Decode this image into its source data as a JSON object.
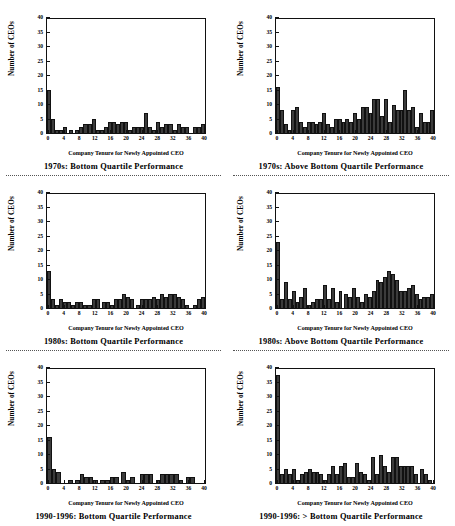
{
  "figure": {
    "axis": {
      "ylabel": "Number of CEOs",
      "xlabel": "Company Tenure for Newly Appointed CEO",
      "yticks": [
        0,
        5,
        10,
        15,
        20,
        25,
        30,
        35,
        40
      ],
      "xticks": [
        0,
        4,
        8,
        12,
        16,
        20,
        24,
        28,
        32,
        36,
        40
      ],
      "ylim": [
        0,
        40
      ],
      "xlim": [
        0,
        41
      ],
      "bar_color": "#3b3b3b",
      "frame_color": "#111111"
    }
  },
  "chart_data": [
    {
      "type": "bar",
      "panel": "top-left",
      "title": "1970s:  Bottom  Quartile  Performance",
      "xlabel": "Company Tenure for Newly Appointed CEO",
      "ylabel": "Number of CEOs",
      "ylim": [
        0,
        40
      ],
      "grid": false,
      "legend": "none",
      "categories": [
        0,
        1,
        2,
        3,
        4,
        5,
        6,
        7,
        8,
        9,
        10,
        11,
        12,
        13,
        14,
        15,
        16,
        17,
        18,
        19,
        20,
        21,
        22,
        23,
        24,
        25,
        26,
        27,
        28,
        29,
        30,
        31,
        32,
        33,
        34,
        35,
        36,
        37,
        38,
        39,
        40
      ],
      "values": [
        15,
        5,
        1,
        1,
        2,
        0,
        1,
        0,
        1,
        2,
        3,
        3,
        5,
        1,
        1,
        2,
        4,
        4,
        3,
        4,
        4,
        1,
        2,
        2,
        2,
        7,
        2,
        1,
        4,
        2,
        3,
        3,
        1,
        3,
        2,
        2,
        0,
        0,
        2,
        2,
        3
      ]
    },
    {
      "type": "bar",
      "panel": "top-right",
      "title": "1970s:  Above  Bottom  Quartile  Performance",
      "xlabel": "Company Tenure for Newly Appointed CEO",
      "ylabel": "Number of CEOs",
      "ylim": [
        0,
        40
      ],
      "grid": false,
      "legend": "none",
      "categories": [
        0,
        1,
        2,
        3,
        4,
        5,
        6,
        7,
        8,
        9,
        10,
        11,
        12,
        13,
        14,
        15,
        16,
        17,
        18,
        19,
        20,
        21,
        22,
        23,
        24,
        25,
        26,
        27,
        28,
        29,
        30,
        31,
        32,
        33,
        34,
        35,
        36,
        37,
        38,
        39,
        40
      ],
      "values": [
        16,
        8,
        3,
        1,
        8,
        9,
        4,
        2,
        4,
        4,
        3,
        4,
        7,
        3,
        2,
        5,
        5,
        4,
        5,
        4,
        7,
        5,
        9,
        9,
        7,
        12,
        12,
        6,
        12,
        4,
        10,
        8,
        8,
        15,
        8,
        9,
        2,
        7,
        4,
        4,
        8
      ]
    },
    {
      "type": "bar",
      "panel": "middle-left",
      "title": "1980s:  Bottom  Quartile  Performance",
      "xlabel": "Company Tenure for Newly Appointed CEO",
      "ylabel": "Number of CEOs",
      "ylim": [
        0,
        40
      ],
      "grid": false,
      "legend": "none",
      "categories": [
        0,
        1,
        2,
        3,
        4,
        5,
        6,
        7,
        8,
        9,
        10,
        11,
        12,
        13,
        14,
        15,
        16,
        17,
        18,
        19,
        20,
        21,
        22,
        23,
        24,
        25,
        26,
        27,
        28,
        29,
        30,
        31,
        32,
        33,
        34,
        35,
        36,
        37,
        38,
        39,
        40
      ],
      "values": [
        13,
        3,
        1,
        3,
        2,
        2,
        1,
        2,
        2,
        1,
        1,
        3,
        3,
        0,
        2,
        2,
        1,
        3,
        3,
        5,
        4,
        3,
        0,
        1,
        3,
        3,
        3,
        4,
        3,
        5,
        4,
        5,
        5,
        4,
        3,
        1,
        0,
        0,
        1,
        3,
        4
      ]
    },
    {
      "type": "bar",
      "panel": "middle-right",
      "title": "1980s:  Above  Bottom  Quartile  Performance",
      "xlabel": "Company Tenure for Newly Appointed CEO",
      "ylabel": "Number of CEOs",
      "ylim": [
        0,
        40
      ],
      "grid": false,
      "legend": "none",
      "categories": [
        0,
        1,
        2,
        3,
        4,
        5,
        6,
        7,
        8,
        9,
        10,
        11,
        12,
        13,
        14,
        15,
        16,
        17,
        18,
        19,
        20,
        21,
        22,
        23,
        24,
        25,
        26,
        27,
        28,
        29,
        30,
        31,
        32,
        33,
        34,
        35,
        36,
        37,
        38,
        39,
        40
      ],
      "values": [
        23,
        3,
        9,
        3,
        6,
        2,
        4,
        7,
        1,
        2,
        3,
        3,
        8,
        3,
        7,
        2,
        6,
        0,
        5,
        4,
        7,
        4,
        2,
        5,
        4,
        6,
        10,
        9,
        11,
        13,
        12,
        10,
        6,
        6,
        7,
        8,
        5,
        3,
        4,
        4,
        5
      ]
    },
    {
      "type": "bar",
      "panel": "bottom-left",
      "title": "1990-1996:  Bottom  Quartile  Performance",
      "xlabel": "Company Tenure for Newly Appointed CEO",
      "ylabel": "Number of CEOs",
      "ylim": [
        0,
        40
      ],
      "grid": false,
      "legend": "none",
      "categories": [
        0,
        1,
        2,
        3,
        4,
        5,
        6,
        7,
        8,
        9,
        10,
        11,
        12,
        13,
        14,
        15,
        16,
        17,
        18,
        19,
        20,
        21,
        22,
        23,
        24,
        25,
        26,
        27,
        28,
        29,
        30,
        31,
        32,
        33,
        34,
        35,
        36,
        37,
        38,
        39,
        40
      ],
      "values": [
        16,
        5,
        4,
        0,
        0,
        0,
        1,
        0,
        1,
        3,
        2,
        2,
        1,
        0,
        1,
        1,
        2,
        2,
        0,
        4,
        1,
        2,
        0,
        0,
        3,
        3,
        3,
        0,
        1,
        3,
        3,
        3,
        3,
        1,
        0,
        2,
        2,
        0,
        0,
        0,
        0
      ]
    },
    {
      "type": "bar",
      "panel": "bottom-right",
      "title": "1990-1996:  >  Bottom  Quartile  Performance",
      "xlabel": "Company Tenure for Newly Appointed CEO",
      "ylabel": "Number of CEOs",
      "ylim": [
        0,
        40
      ],
      "grid": false,
      "legend": "none",
      "categories": [
        0,
        1,
        2,
        3,
        4,
        5,
        6,
        7,
        8,
        9,
        10,
        11,
        12,
        13,
        14,
        15,
        16,
        17,
        18,
        19,
        20,
        21,
        22,
        23,
        24,
        25,
        26,
        27,
        28,
        29,
        30,
        31,
        32,
        33,
        34,
        35,
        36,
        37,
        38,
        39,
        40
      ],
      "values": [
        38,
        3,
        5,
        3,
        5,
        1,
        3,
        4,
        5,
        4,
        4,
        3,
        1,
        3,
        6,
        3,
        6,
        7,
        2,
        2,
        7,
        4,
        3,
        1,
        9,
        3,
        10,
        6,
        4,
        9,
        9,
        6,
        6,
        6,
        6,
        3,
        0,
        5,
        3,
        1,
        0
      ]
    }
  ]
}
